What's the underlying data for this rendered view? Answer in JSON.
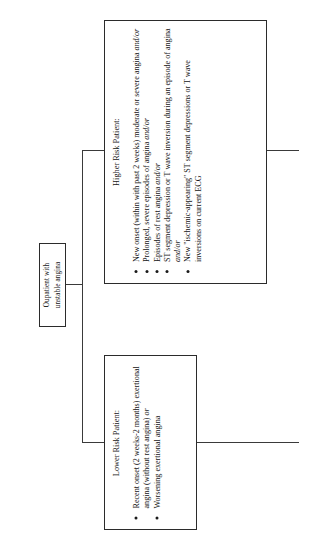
{
  "diagram": {
    "orientation": "rotated-90-ccw",
    "line_color": "#3a3a3a",
    "border_color": "#2b2b2b",
    "text_color": "#141414"
  },
  "start": {
    "line1": "Oupatient with",
    "line2": "unstable angina"
  },
  "higher_risk": {
    "title": "Higher Risk Patient:",
    "bullets": [
      {
        "text": "New onset (within with past 2 weeks) moderate or severe angina ",
        "emphasis": "and/or"
      },
      {
        "text": "Prolonged, severe episodes of angina ",
        "emphasis": "and/or"
      },
      {
        "text": "Episodes of rest angina ",
        "emphasis": "and/or"
      },
      {
        "text": "ST segment depression or T wave inversion during an episode of angina ",
        "emphasis": "and/or"
      },
      {
        "text": "New \"ischemic-appearing\" ST segment depressions or T wave inversions on current ECG",
        "emphasis": ""
      }
    ]
  },
  "lower_risk": {
    "title": "Lower Risk Patient:",
    "bullets": [
      {
        "text": "Recent onset (2 weeks-2 months) exertional angina (without rest angina) ",
        "emphasis": "or"
      },
      {
        "text": "Worsening exertional angina",
        "emphasis": ""
      }
    ]
  },
  "connectors": {
    "start_to_split": "lead-out",
    "split_spine": "spine",
    "split_to_higher": "branch-hi",
    "split_to_lower": "branch-lo",
    "higher_exit": "exit-hi",
    "lower_exit": "exit-lo"
  }
}
